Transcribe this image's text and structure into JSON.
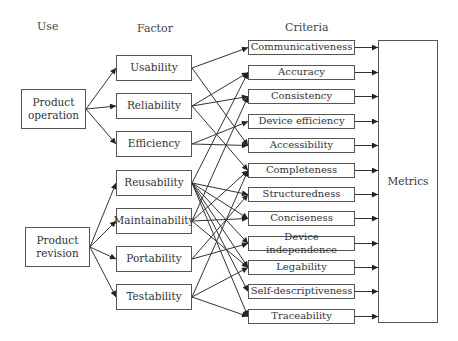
{
  "headers": {
    "use": "Use",
    "factor": "Factor",
    "criteria": "Criteria"
  },
  "uses": [
    {
      "id": "op",
      "label": "Product operation",
      "line1": "Product",
      "line2": "operation",
      "x": 21,
      "y": 89,
      "w": 65,
      "h": 40
    },
    {
      "id": "rev",
      "label": "Product revision",
      "line1": "Product",
      "line2": "revision",
      "x": 25,
      "y": 227,
      "w": 65,
      "h": 40
    }
  ],
  "factors": [
    {
      "id": "usa",
      "label": "Usability",
      "y": 55
    },
    {
      "id": "rel",
      "label": "Reliability",
      "y": 93
    },
    {
      "id": "eff",
      "label": "Efficiency",
      "y": 131
    },
    {
      "id": "reu",
      "label": "Reusability",
      "y": 170
    },
    {
      "id": "mai",
      "label": "Maintainability",
      "y": 208
    },
    {
      "id": "por",
      "label": "Portability",
      "y": 246
    },
    {
      "id": "tes",
      "label": "Testability",
      "y": 284
    }
  ],
  "criteria": [
    {
      "label": "Communicativeness",
      "y": 40
    },
    {
      "label": "Accuracy",
      "y": 65
    },
    {
      "label": "Consistency",
      "y": 89
    },
    {
      "label": "Device efficiency",
      "y": 114
    },
    {
      "label": "Accessibility",
      "y": 138
    },
    {
      "label": "Completeness",
      "y": 163
    },
    {
      "label": "Structuredness",
      "y": 187
    },
    {
      "label": "Conciseness",
      "y": 211
    },
    {
      "label": "Device independence",
      "y": 236
    },
    {
      "label": "Legability",
      "y": 260
    },
    {
      "label": "Self-descriptiveness",
      "y": 284
    },
    {
      "label": "Traceability",
      "y": 309
    }
  ],
  "metrics": {
    "label": "Metrics",
    "x": 378,
    "y": 40,
    "w": 60,
    "h": 283
  },
  "use_factor_links": {
    "op": [
      "usa",
      "rel",
      "eff"
    ],
    "rev": [
      "reu",
      "mai",
      "por",
      "tes"
    ]
  },
  "factor_criteria_links": {
    "usa": [
      0,
      4
    ],
    "rel": [
      1,
      2,
      5
    ],
    "eff": [
      3,
      4
    ],
    "reu": [
      1,
      6,
      7,
      8,
      9,
      10,
      11
    ],
    "mai": [
      2,
      5,
      7,
      9
    ],
    "por": [
      6,
      8
    ],
    "tes": [
      5,
      9,
      11
    ]
  }
}
